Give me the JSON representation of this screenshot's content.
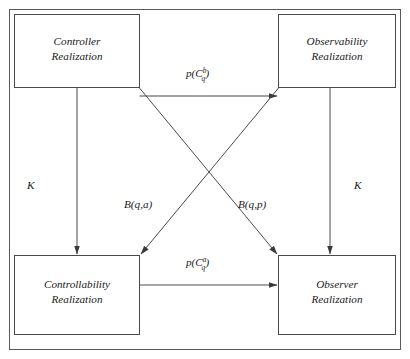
{
  "diagram": {
    "nodes": [
      {
        "id": "controller",
        "line1": "Controller",
        "line2": "Realization"
      },
      {
        "id": "observability",
        "line1": "Observability",
        "line2": "Realization"
      },
      {
        "id": "controllability",
        "line1": "Controllability",
        "line2": "Realization"
      },
      {
        "id": "observer",
        "line1": "Observer",
        "line2": "Realization"
      }
    ],
    "edges": [
      {
        "id": "controller-to-observability",
        "label_base": "p(C",
        "label_sub": "q",
        "label_sup": "b",
        "label_close": ")",
        "label_plain": "p(C_q^b)",
        "from": "controller",
        "to": "observability"
      },
      {
        "id": "controllability-to-observer",
        "label_base": "p(C",
        "label_sub": "q",
        "label_sup": "a",
        "label_close": ")",
        "label_plain": "p(C_q^a)",
        "from": "controllability",
        "to": "observer"
      },
      {
        "id": "controller-to-controllability",
        "label_plain": "K",
        "from": "controller",
        "to": "controllability"
      },
      {
        "id": "observability-to-observer",
        "label_plain": "K",
        "from": "observability",
        "to": "observer"
      },
      {
        "id": "observability-to-controllability",
        "label_plain": "B(q,a)",
        "from": "observability",
        "to": "controllability"
      },
      {
        "id": "controller-to-observer",
        "label_plain": "B(q,p)",
        "from": "controller",
        "to": "observer"
      }
    ],
    "colors": {
      "stroke": "#4a4a4a",
      "text": "#1a1a1a",
      "background": "#ffffff"
    }
  }
}
